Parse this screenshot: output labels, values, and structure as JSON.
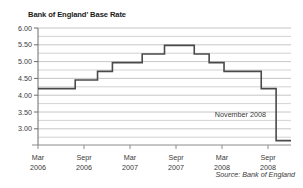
{
  "chart_data": {
    "type": "line",
    "title": "Bank of England' Base Rate",
    "xlabel": "",
    "ylabel": "",
    "ylim": [
      2.875,
      6.25
    ],
    "xlim": [
      0,
      34
    ],
    "grid": true,
    "grid_minor_step": 0.25,
    "legend": "none",
    "source": "Source: Bank of England",
    "yticks": [
      6.0,
      5.5,
      5.0,
      4.5,
      4.0,
      3.5,
      3.0
    ],
    "ytick_labels": [
      "6.00",
      "5.50",
      "5.00",
      "4.50",
      "4.00",
      "3.50",
      "3.00"
    ],
    "xticks": [
      0,
      6,
      12,
      18,
      24,
      30
    ],
    "xtick_labels": [
      {
        "month": "Mar",
        "year": "2006"
      },
      {
        "month": "Sepr",
        "year": "2006"
      },
      {
        "month": "Mar",
        "year": "2007"
      },
      {
        "month": "Sepr",
        "year": "2007"
      },
      {
        "month": "Mar",
        "year": "2008"
      },
      {
        "month": "Sepr",
        "year": "2008"
      }
    ],
    "series": [
      {
        "name": "Base Rate",
        "step": "post",
        "color": "#4a4a4a",
        "points": [
          {
            "x": 0,
            "date": "Mar 2006",
            "value": 4.5
          },
          {
            "x": 5,
            "date": "Aug 2006",
            "value": 4.75
          },
          {
            "x": 8,
            "date": "Nov 2006",
            "value": 5.0
          },
          {
            "x": 10,
            "date": "Jan 2007",
            "value": 5.25
          },
          {
            "x": 14,
            "date": "May 2007",
            "value": 5.5
          },
          {
            "x": 17,
            "date": "Jul 2007",
            "value": 5.75
          },
          {
            "x": 21,
            "date": "Dec 2007",
            "value": 5.5
          },
          {
            "x": 23,
            "date": "Feb 2008",
            "value": 5.25
          },
          {
            "x": 25,
            "date": "Apr 2008",
            "value": 5.0
          },
          {
            "x": 30,
            "date": "Oct 2008",
            "value": 4.5
          },
          {
            "x": 32,
            "date": "Nov 2008",
            "value": 3.0
          }
        ]
      }
    ],
    "annotations": [
      {
        "text": "November 2008",
        "value": 3.5,
        "x": 32
      }
    ]
  }
}
